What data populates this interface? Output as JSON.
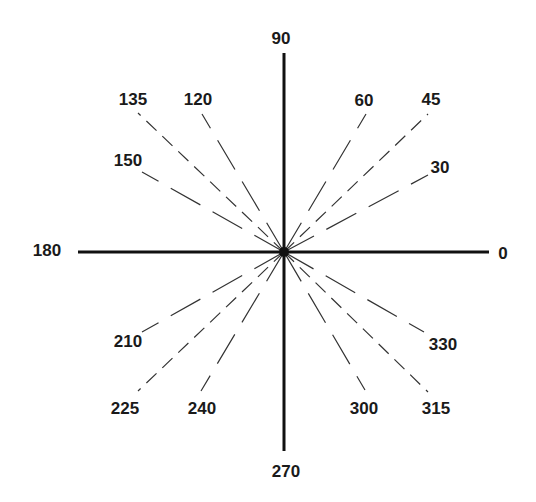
{
  "diagram": {
    "center": [
      284,
      252
    ],
    "colors": {
      "axis": "#111111",
      "ray": "#333333",
      "label": "#1a1a1a",
      "background": "#ffffff"
    },
    "axes": [
      {
        "name": "horizontal",
        "from": [
          78,
          252
        ],
        "to": [
          489,
          252
        ]
      },
      {
        "name": "vertical",
        "from": [
          284,
          53
        ],
        "to": [
          284,
          451
        ]
      }
    ],
    "axis_labels": [
      {
        "text": "0",
        "x": 503,
        "y": 259
      },
      {
        "text": "90",
        "x": 281,
        "y": 44
      },
      {
        "text": "180",
        "x": 47,
        "y": 256
      },
      {
        "text": "270",
        "x": 286,
        "y": 477
      }
    ],
    "rays": [
      {
        "angle": 30,
        "end": [
          428,
          175
        ],
        "dash": "long",
        "label": {
          "text": "30",
          "x": 440,
          "y": 173
        }
      },
      {
        "angle": 45,
        "end": [
          428,
          114
        ],
        "dash": "short",
        "label": {
          "text": "45",
          "x": 431,
          "y": 105
        }
      },
      {
        "angle": 60,
        "end": [
          366,
          114
        ],
        "dash": "long",
        "label": {
          "text": "60",
          "x": 364,
          "y": 106
        }
      },
      {
        "angle": 120,
        "end": [
          202,
          114
        ],
        "dash": "long",
        "label": {
          "text": "120",
          "x": 198,
          "y": 105
        }
      },
      {
        "angle": 135,
        "end": [
          138,
          113
        ],
        "dash": "short",
        "label": {
          "text": "135",
          "x": 133,
          "y": 105
        }
      },
      {
        "angle": 150,
        "end": [
          142,
          172
        ],
        "dash": "long",
        "label": {
          "text": "150",
          "x": 128,
          "y": 166
        }
      },
      {
        "angle": 210,
        "end": [
          142,
          332
        ],
        "dash": "long",
        "label": {
          "text": "210",
          "x": 128,
          "y": 347
        }
      },
      {
        "angle": 225,
        "end": [
          138,
          391
        ],
        "dash": "short",
        "label": {
          "text": "225",
          "x": 125,
          "y": 414
        }
      },
      {
        "angle": 240,
        "end": [
          201,
          391
        ],
        "dash": "long",
        "label": {
          "text": "240",
          "x": 202,
          "y": 414
        }
      },
      {
        "angle": 300,
        "end": [
          365,
          390
        ],
        "dash": "long",
        "label": {
          "text": "300",
          "x": 364,
          "y": 414
        }
      },
      {
        "angle": 315,
        "end": [
          428,
          392
        ],
        "dash": "short",
        "label": {
          "text": "315",
          "x": 436,
          "y": 414
        }
      },
      {
        "angle": 330,
        "end": [
          424,
          332
        ],
        "dash": "long",
        "label": {
          "text": "330",
          "x": 443,
          "y": 350
        }
      }
    ]
  }
}
